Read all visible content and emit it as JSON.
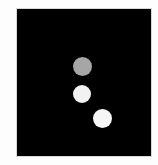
{
  "image": {
    "background": "#fdfdfd",
    "frame": {
      "color": "#000000",
      "border": "#d8d8d8",
      "x": 17,
      "y": 9,
      "width": 134,
      "height": 147
    },
    "dots": [
      {
        "name": "gray-dot",
        "cx": 82,
        "cy": 66,
        "diameter": 19,
        "color": "#a6a6a6"
      },
      {
        "name": "white-dot-middle",
        "cx": 82,
        "cy": 94,
        "diameter": 18,
        "color": "#f2f2f2"
      },
      {
        "name": "white-dot-lower",
        "cx": 102,
        "cy": 118,
        "diameter": 19,
        "color": "#f6f6f6"
      }
    ]
  }
}
